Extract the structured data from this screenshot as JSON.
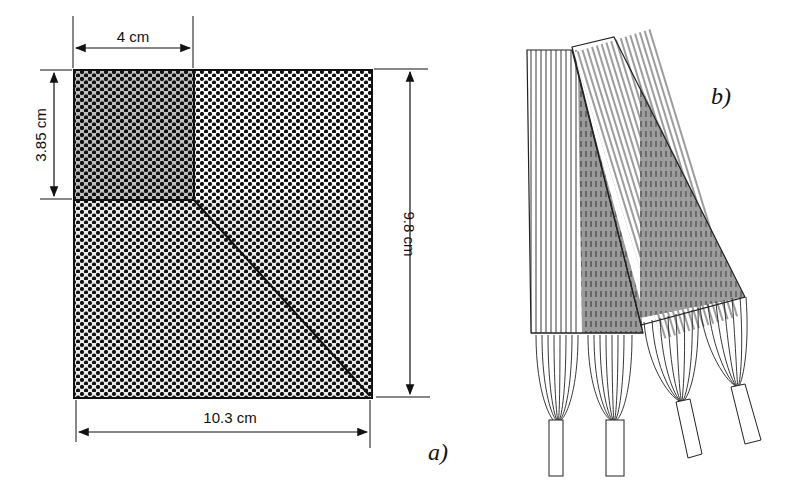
{
  "panel_a": {
    "label": "a)",
    "dimensions": {
      "top_width": "4 cm",
      "left_height": "3.85 cm",
      "right_height": "9.8 cm",
      "bottom_width": "10.3 cm"
    }
  },
  "panel_b": {
    "label": "b)"
  },
  "colors": {
    "ink": "#111111",
    "dark_fill": "#8a8a8a",
    "mid_fill": "#a8a8a8",
    "background": "#ffffff"
  }
}
